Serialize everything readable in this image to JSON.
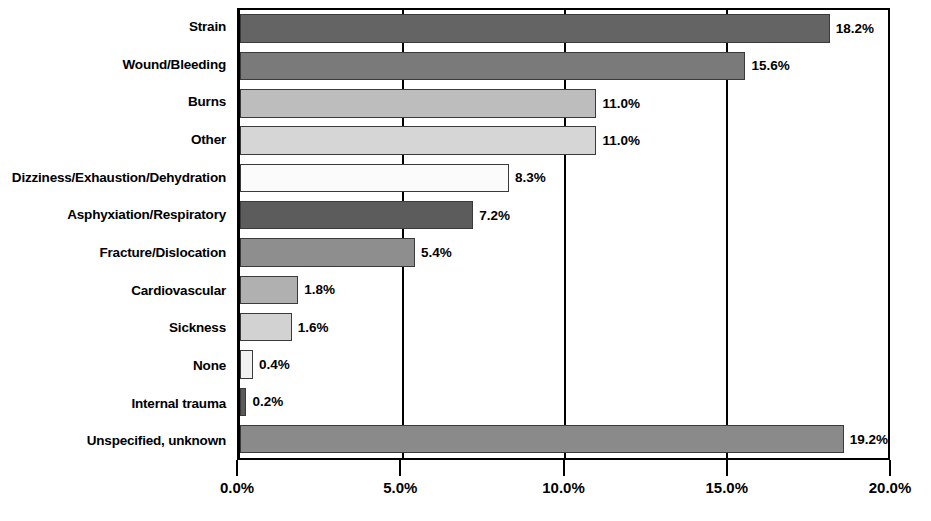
{
  "chart_data": {
    "type": "bar",
    "orientation": "horizontal",
    "title": "",
    "subtitle": "",
    "xlabel": "",
    "ylabel": "",
    "xlim": [
      0,
      20
    ],
    "grid": true,
    "legend": null,
    "xticks": [
      "0.0%",
      "5.0%",
      "10.0%",
      "15.0%",
      "20.0%"
    ],
    "xtick_values": [
      0,
      5,
      10,
      15,
      20
    ],
    "categories": [
      "Strain",
      "Wound/Bleeding",
      "Burns",
      "Other",
      "Dizziness/Exhaustion/Dehydration",
      "Asphyxiation/Respiratory",
      "Fracture/Dislocation",
      "Cardiovascular",
      "Sickness",
      "None",
      "Internal trauma",
      "Unspecified, unknown"
    ],
    "values": [
      18.2,
      15.6,
      11.0,
      11.0,
      8.3,
      7.2,
      5.4,
      1.8,
      1.6,
      0.4,
      0.2,
      19.2
    ],
    "value_labels": [
      "18.2%",
      "15.6%",
      "11.0%",
      "11.0%",
      "8.3%",
      "7.2%",
      "5.4%",
      "1.8%",
      "1.6%",
      "0.4%",
      "0.2%",
      "19.2%"
    ],
    "bar_colors": [
      "#646464",
      "#7a7a7a",
      "#bdbdbd",
      "#d6d6d6",
      "#fbfbfb",
      "#5c5c5c",
      "#8e8e8e",
      "#b0b0b0",
      "#d2d2d2",
      "#f2f2f2",
      "#5a5a5a",
      "#8a8a8a"
    ],
    "axis_color": "#000000",
    "label_color": "#000000"
  }
}
